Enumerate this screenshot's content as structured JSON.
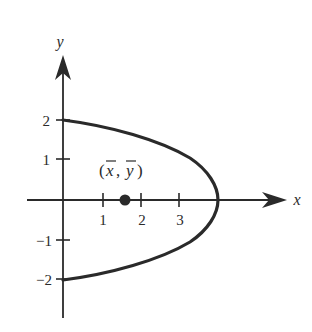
{
  "figure": {
    "type": "diagram",
    "axes": {
      "x_label": "x",
      "y_label": "y",
      "x_ticks": [
        "1",
        "2",
        "3"
      ],
      "y_ticks": [
        "2",
        "1",
        "−1",
        "−2"
      ]
    },
    "curve": {
      "equation": "x = 4 - y^2",
      "vertex": [
        4,
        0
      ],
      "y_intercepts": [
        2,
        -2
      ]
    },
    "centroid": {
      "label": "(x̄, ȳ)",
      "label_x": "x",
      "label_y": "y",
      "approx_position": [
        1.6,
        0
      ]
    },
    "colors": {
      "stroke": "#2a2a2a",
      "background": "#ffffff"
    }
  }
}
